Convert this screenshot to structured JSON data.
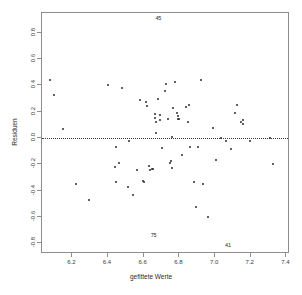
{
  "figure": {
    "title_remnant": "",
    "background": "#ffffff",
    "point_color": "#2b2b2b",
    "frame_color": "#8d8d8d",
    "zero_line_color": "#3a3a3a"
  },
  "chart_data": {
    "type": "scatter",
    "title": "",
    "xlabel": "gefittete Werte",
    "ylabel": "Residuen",
    "xlim": [
      6.03,
      7.42
    ],
    "ylim": [
      -0.88,
      0.95
    ],
    "grid": false,
    "legend": null,
    "xticks": [
      6.2,
      6.4,
      6.6,
      6.8,
      7.0,
      7.2,
      7.4
    ],
    "xticklabels": [
      "6.2",
      "6.4",
      "6.6",
      "6.8",
      "7.0",
      "7.2",
      "7.4"
    ],
    "yticks": [
      0.8,
      0.6,
      0.4,
      0.2,
      0.0,
      -0.2,
      -0.4,
      -0.6,
      -0.8
    ],
    "yticklabels": [
      "0.8",
      "0.6",
      "0.4",
      "0.2",
      "0.0",
      "-0.2",
      "-0.4",
      "-0.6",
      "-0.8"
    ],
    "reference_lines": [
      {
        "axis": "y",
        "value": 0.0,
        "style": "dotted"
      }
    ],
    "annotations": [
      {
        "text": "45",
        "x": 6.682,
        "y": 0.915
      },
      {
        "text": "75",
        "x": 6.655,
        "y": -0.735
      },
      {
        "text": "41",
        "x": 7.072,
        "y": -0.808
      }
    ],
    "points": [
      {
        "x": 6.075,
        "y": 0.442
      },
      {
        "x": 6.095,
        "y": 0.33
      },
      {
        "x": 6.148,
        "y": 0.068
      },
      {
        "x": 6.222,
        "y": -0.348
      },
      {
        "x": 6.293,
        "y": -0.468
      },
      {
        "x": 6.398,
        "y": 0.404
      },
      {
        "x": 6.438,
        "y": -0.222
      },
      {
        "x": 6.445,
        "y": -0.07
      },
      {
        "x": 6.447,
        "y": -0.335
      },
      {
        "x": 6.462,
        "y": -0.192
      },
      {
        "x": 6.48,
        "y": 0.378
      },
      {
        "x": 6.512,
        "y": -0.372
      },
      {
        "x": 6.52,
        "y": -0.022
      },
      {
        "x": 6.54,
        "y": -0.43
      },
      {
        "x": 6.565,
        "y": -0.245
      },
      {
        "x": 6.582,
        "y": 0.293
      },
      {
        "x": 6.596,
        "y": -0.322
      },
      {
        "x": 6.604,
        "y": -0.333
      },
      {
        "x": 6.612,
        "y": 0.272
      },
      {
        "x": 6.616,
        "y": 0.243
      },
      {
        "x": 6.627,
        "y": -0.208
      },
      {
        "x": 6.634,
        "y": -0.24
      },
      {
        "x": 6.648,
        "y": -0.238
      },
      {
        "x": 6.652,
        "y": -0.238
      },
      {
        "x": 6.663,
        "y": 0.186
      },
      {
        "x": 6.665,
        "y": 0.152
      },
      {
        "x": 6.667,
        "y": 0.122
      },
      {
        "x": 6.668,
        "y": 0.04
      },
      {
        "x": 6.678,
        "y": 0.3
      },
      {
        "x": 6.69,
        "y": 0.178
      },
      {
        "x": 6.694,
        "y": 0.14
      },
      {
        "x": 6.7,
        "y": -0.076
      },
      {
        "x": 6.718,
        "y": 0.356
      },
      {
        "x": 6.726,
        "y": 0.41
      },
      {
        "x": 6.736,
        "y": 0.144
      },
      {
        "x": 6.75,
        "y": -0.186
      },
      {
        "x": 6.754,
        "y": -0.176
      },
      {
        "x": 6.756,
        "y": -0.228
      },
      {
        "x": 6.758,
        "y": 0.01
      },
      {
        "x": 6.762,
        "y": 0.232
      },
      {
        "x": 6.774,
        "y": 0.427
      },
      {
        "x": 6.786,
        "y": 0.19
      },
      {
        "x": 6.79,
        "y": 0.168
      },
      {
        "x": 6.794,
        "y": 0.148
      },
      {
        "x": 6.8,
        "y": 0.146
      },
      {
        "x": 6.812,
        "y": -0.13
      },
      {
        "x": 6.838,
        "y": 0.238
      },
      {
        "x": 6.846,
        "y": 0.126
      },
      {
        "x": 6.852,
        "y": 0.25
      },
      {
        "x": 6.862,
        "y": -0.065
      },
      {
        "x": 6.88,
        "y": -0.335
      },
      {
        "x": 6.892,
        "y": -0.52
      },
      {
        "x": 6.906,
        "y": -0.068
      },
      {
        "x": 6.92,
        "y": 0.443
      },
      {
        "x": 6.932,
        "y": -0.352
      },
      {
        "x": 6.962,
        "y": -0.598
      },
      {
        "x": 6.99,
        "y": 0.078
      },
      {
        "x": 7.004,
        "y": -0.168
      },
      {
        "x": 7.036,
        "y": 0.004
      },
      {
        "x": 7.062,
        "y": -0.02
      },
      {
        "x": 7.09,
        "y": -0.086
      },
      {
        "x": 7.11,
        "y": 0.19
      },
      {
        "x": 7.122,
        "y": 0.252
      },
      {
        "x": 7.148,
        "y": 0.122
      },
      {
        "x": 7.154,
        "y": 0.138
      },
      {
        "x": 7.156,
        "y": 0.106
      },
      {
        "x": 7.198,
        "y": -0.024
      },
      {
        "x": 7.31,
        "y": 0.0
      },
      {
        "x": 7.322,
        "y": -0.198
      }
    ]
  }
}
